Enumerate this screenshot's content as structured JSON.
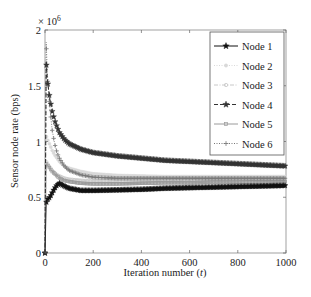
{
  "chart_data": {
    "type": "line",
    "title": "",
    "xlabel": "Iteration number (t)",
    "xlabel_parts": [
      "Iteration number (",
      "t",
      ")"
    ],
    "ylabel": "Sensor node rate (bps)",
    "y_multiplier": "× 10",
    "y_multiplier_exp": "6",
    "xlim": [
      0,
      1000
    ],
    "ylim": [
      0,
      2
    ],
    "xticks": [
      0,
      200,
      400,
      600,
      800,
      1000
    ],
    "xtick_labels": [
      "0",
      "200",
      "400",
      "600",
      "800",
      "1000"
    ],
    "yticks": [
      0,
      0.5,
      1,
      1.5,
      2
    ],
    "ytick_labels": [
      "0",
      "0.5",
      "1",
      "1.5",
      "2"
    ],
    "grid": false,
    "legend_position": "top-right",
    "x": [
      0,
      5,
      10,
      20,
      30,
      40,
      50,
      60,
      80,
      100,
      150,
      200,
      300,
      400,
      500,
      600,
      700,
      800,
      900,
      1000
    ],
    "series": [
      {
        "name": "Node 1",
        "marker": "star",
        "line": "solid",
        "color": "#111111",
        "values": [
          0,
          0.45,
          0.48,
          0.5,
          0.54,
          0.58,
          0.61,
          0.625,
          0.6,
          0.58,
          0.56,
          0.56,
          0.565,
          0.57,
          0.58,
          0.585,
          0.59,
          0.595,
          0.6,
          0.605
        ]
      },
      {
        "name": "Node 2",
        "marker": "circle-filled",
        "line": "dotted",
        "color": "#d9d9d9",
        "values": [
          0,
          1.05,
          1.02,
          0.97,
          0.92,
          0.88,
          0.85,
          0.82,
          0.78,
          0.76,
          0.73,
          0.71,
          0.695,
          0.69,
          0.685,
          0.685,
          0.685,
          0.685,
          0.685,
          0.685
        ]
      },
      {
        "name": "Node 3",
        "marker": "circle-open",
        "line": "dashdot",
        "color": "#c8c8c8",
        "values": [
          0,
          0.82,
          0.8,
          0.77,
          0.74,
          0.72,
          0.7,
          0.69,
          0.67,
          0.66,
          0.65,
          0.645,
          0.645,
          0.645,
          0.65,
          0.65,
          0.655,
          0.655,
          0.66,
          0.66
        ]
      },
      {
        "name": "Node 4",
        "marker": "star",
        "line": "dashed",
        "color": "#333333",
        "values": [
          0,
          1.72,
          1.55,
          1.38,
          1.27,
          1.19,
          1.13,
          1.08,
          1.02,
          0.98,
          0.93,
          0.9,
          0.87,
          0.85,
          0.83,
          0.82,
          0.81,
          0.8,
          0.79,
          0.78
        ]
      },
      {
        "name": "Node 5",
        "marker": "square-open",
        "line": "solid",
        "color": "#9a9a9a",
        "values": [
          0,
          0.8,
          0.79,
          0.76,
          0.73,
          0.71,
          0.69,
          0.67,
          0.65,
          0.64,
          0.625,
          0.62,
          0.62,
          0.625,
          0.63,
          0.63,
          0.635,
          0.635,
          0.64,
          0.64
        ]
      },
      {
        "name": "Node 6",
        "marker": "plus",
        "line": "dotted",
        "color": "#777777",
        "values": [
          0,
          1.89,
          1.6,
          1.3,
          1.1,
          0.98,
          0.9,
          0.85,
          0.78,
          0.74,
          0.7,
          0.68,
          0.67,
          0.67,
          0.67,
          0.67,
          0.67,
          0.67,
          0.67,
          0.67
        ]
      }
    ]
  }
}
